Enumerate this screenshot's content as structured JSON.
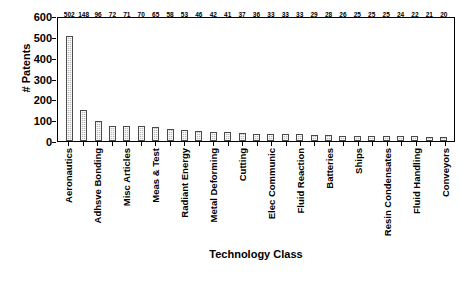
{
  "chart_data": {
    "type": "bar",
    "title": "",
    "xlabel": "Technology Class",
    "ylabel": "# Patents",
    "ylim": [
      0,
      600
    ],
    "yticks": [
      0,
      100,
      200,
      300,
      400,
      500,
      600
    ],
    "grid": false,
    "legend": null,
    "bar_color": "#b9b9b9",
    "bar_edge_color": "#4a4a4a",
    "categories": [
      "Aeronautics",
      "",
      "Adhsve Bonding",
      "",
      "Misc Articles",
      "",
      "Meas & Test",
      "",
      "Radiant Energy",
      "",
      "Metal Deforming",
      "",
      "Cutting",
      "",
      "Elec Communic",
      "",
      "Fluid Reaction",
      "",
      "Batteries",
      "",
      "Ships",
      "",
      "Resin Condensates",
      "",
      "Fluid Handling",
      "",
      "Conveyors"
    ],
    "values": [
      502,
      148,
      96,
      72,
      71,
      70,
      65,
      58,
      53,
      46,
      42,
      41,
      37,
      36,
      33,
      33,
      33,
      29,
      28,
      26,
      25,
      25,
      25,
      24,
      22,
      21,
      20
    ]
  }
}
